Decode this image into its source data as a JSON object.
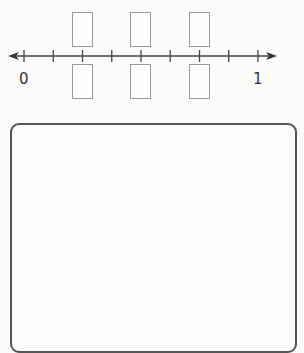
{
  "number_line": {
    "start_label": "0",
    "end_label": "1",
    "intervals": 8,
    "boxed_ticks": [
      2,
      4,
      6
    ],
    "answer_boxes_top": [
      "",
      "",
      ""
    ],
    "answer_boxes_bottom": [
      "",
      "",
      ""
    ]
  },
  "work_area": {
    "content": ""
  },
  "colors": {
    "line": "#444444",
    "box_border": "#9a9a9a",
    "work_border": "#555555"
  }
}
